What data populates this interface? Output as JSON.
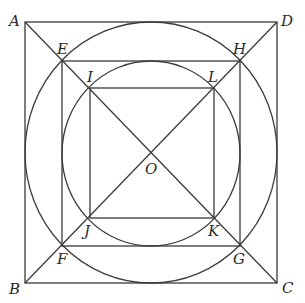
{
  "diagram": {
    "points": {
      "A": {
        "label": "A",
        "x": 25,
        "y": 22
      },
      "D": {
        "label": "D",
        "x": 277,
        "y": 22
      },
      "B": {
        "label": "B",
        "x": 25,
        "y": 283
      },
      "C": {
        "label": "C",
        "x": 277,
        "y": 283
      },
      "E": {
        "label": "E",
        "x": 62,
        "y": 61
      },
      "H": {
        "label": "H",
        "x": 240,
        "y": 61
      },
      "F": {
        "label": "F",
        "x": 62,
        "y": 246
      },
      "G": {
        "label": "G",
        "x": 240,
        "y": 246
      },
      "I": {
        "label": "I",
        "x": 90,
        "y": 88
      },
      "L": {
        "label": "L",
        "x": 214,
        "y": 88
      },
      "J": {
        "label": "J",
        "x": 90,
        "y": 218
      },
      "K": {
        "label": "K",
        "x": 214,
        "y": 218
      },
      "O": {
        "label": "O",
        "x": 151,
        "y": 153
      }
    },
    "shapes": {
      "outer_square": "ABCD",
      "middle_square": "EHGF",
      "inner_square": "ILKJ",
      "outer_circle": "inscribed in ABCD, through E,H,G,F",
      "inner_circle": "inscribed in EHGF, through I,L,K,J",
      "diagonals": [
        "AC",
        "BD"
      ]
    }
  }
}
